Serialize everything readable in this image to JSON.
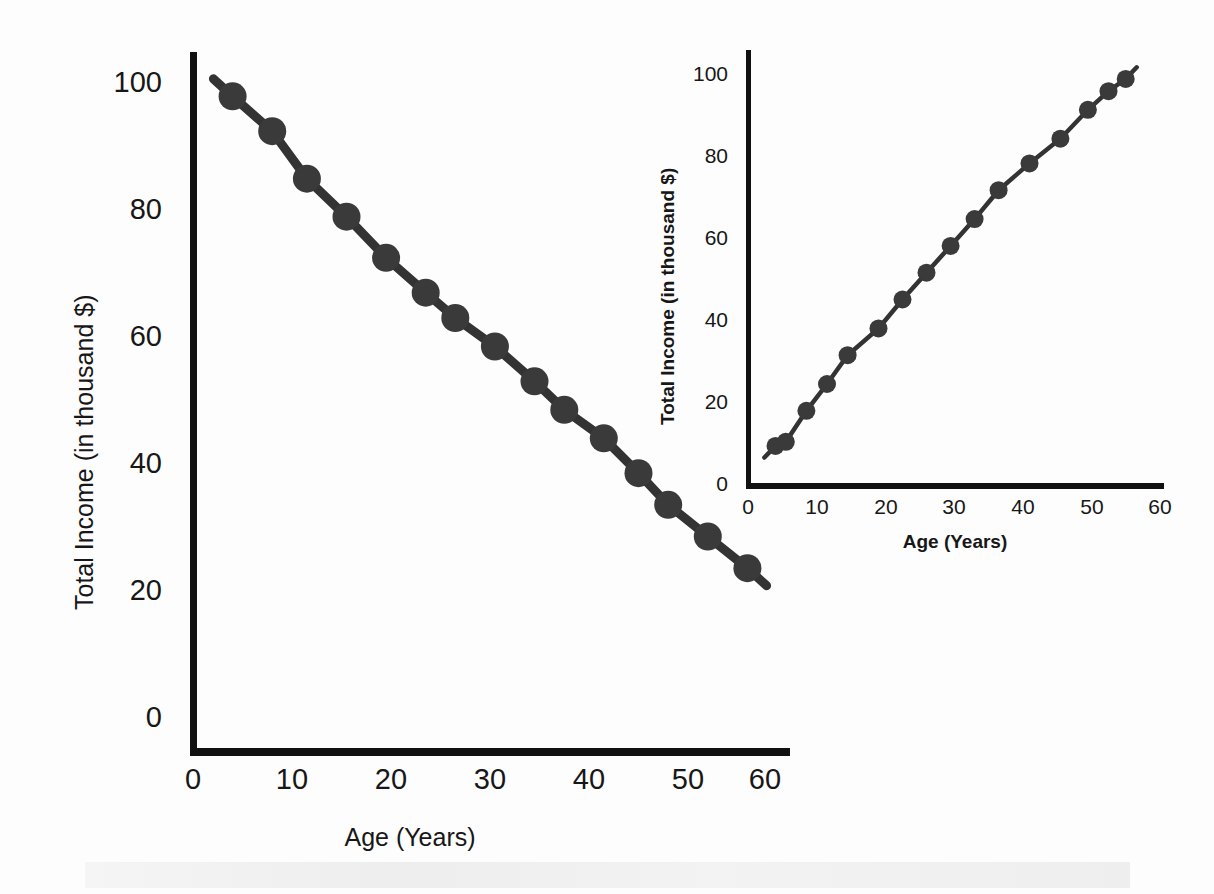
{
  "figure": {
    "background_color": "#ffffff",
    "axis_color": "#111111",
    "marker_color": "#3a3a3a",
    "line_color": "#333333"
  },
  "main_chart": {
    "xlabel": "Age (Years)",
    "ylabel": "Total Income (in thousand $)",
    "xticks": [
      "0",
      "10",
      "20",
      "30",
      "40",
      "50",
      "60"
    ],
    "yticks": [
      "0",
      "20",
      "40",
      "60",
      "80",
      "100"
    ]
  },
  "inset_chart": {
    "xlabel": "Age (Years)",
    "ylabel": "Total Income (in thousand $)",
    "xticks": [
      "0",
      "10",
      "20",
      "30",
      "40",
      "50",
      "60"
    ],
    "yticks": [
      "0",
      "20",
      "40",
      "60",
      "80",
      "100"
    ]
  },
  "chart_data": [
    {
      "type": "scatter",
      "id": "main-negative-correlation",
      "title": "",
      "xlabel": "Age (Years)",
      "ylabel": "Total Income (in thousand $)",
      "xlim": [
        0,
        60
      ],
      "ylim": [
        0,
        105
      ],
      "xticks": [
        0,
        10,
        20,
        30,
        40,
        50,
        60
      ],
      "yticks": [
        0,
        20,
        40,
        60,
        80,
        100
      ],
      "grid": false,
      "legend": "none",
      "connected_line": true,
      "marker_shape": "circle",
      "marker_color": "#3a3a3a",
      "relationship": "negative linear",
      "x": [
        4,
        8,
        11.5,
        15.5,
        19.5,
        23.5,
        26.5,
        30.5,
        34.5,
        37.5,
        41.5,
        45,
        48,
        52,
        56
      ],
      "y": [
        98,
        92.5,
        85,
        79,
        72.5,
        67,
        63,
        58.5,
        53,
        48.5,
        44,
        38.5,
        33.5,
        28.5,
        23.5
      ]
    },
    {
      "type": "scatter",
      "id": "inset-positive-correlation",
      "title": "",
      "xlabel": "Age (Years)",
      "ylabel": "Total Income (in thousand $)",
      "xlim": [
        0,
        60
      ],
      "ylim": [
        0,
        105
      ],
      "xticks": [
        0,
        10,
        20,
        30,
        40,
        50,
        60
      ],
      "yticks": [
        0,
        20,
        40,
        60,
        80,
        100
      ],
      "grid": false,
      "legend": "none",
      "connected_line": true,
      "marker_shape": "circle",
      "marker_color": "#3a3a3a",
      "relationship": "positive linear",
      "x": [
        4,
        5.5,
        8.5,
        11.5,
        14.5,
        19,
        22.5,
        26,
        29.5,
        33,
        36.5,
        41,
        45.5,
        49.5,
        52.5,
        55
      ],
      "y": [
        9,
        10,
        17.5,
        24,
        31,
        37.5,
        44.5,
        51,
        57.5,
        64,
        71,
        77.5,
        83.5,
        90.5,
        95,
        98
      ]
    }
  ]
}
